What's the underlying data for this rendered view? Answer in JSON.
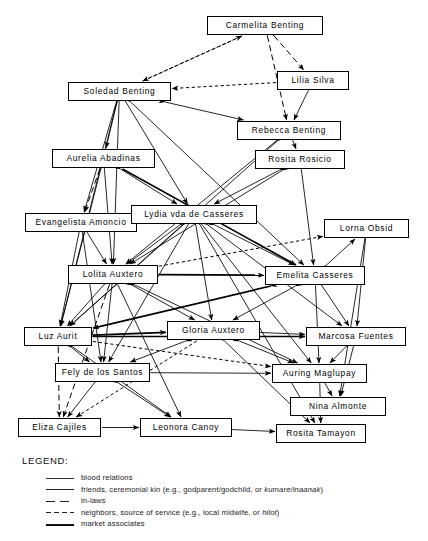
{
  "diagram": {
    "nodes": [
      {
        "id": "carmelita",
        "label": "Carmelita Benting",
        "x": 207,
        "y": 16,
        "w": 116,
        "h": 19
      },
      {
        "id": "lilia",
        "label": "Lilia Silva",
        "x": 277,
        "y": 71,
        "w": 72,
        "h": 19
      },
      {
        "id": "soledad",
        "label": "Soledad Benting",
        "x": 68,
        "y": 82,
        "w": 103,
        "h": 19
      },
      {
        "id": "rebecca",
        "label": "Rebecca Benting",
        "x": 237,
        "y": 121,
        "w": 104,
        "h": 19
      },
      {
        "id": "aurelia",
        "label": "Aurelia Abadinas",
        "x": 52,
        "y": 149,
        "w": 103,
        "h": 19
      },
      {
        "id": "rosita_r",
        "label": "Rosita Rosicio",
        "x": 255,
        "y": 150,
        "w": 90,
        "h": 19
      },
      {
        "id": "evangelista",
        "label": "Evangelista Amoncio",
        "x": 25,
        "y": 213,
        "w": 112,
        "h": 19
      },
      {
        "id": "lydia",
        "label": "Lydia vda de Casseres",
        "x": 131,
        "y": 205,
        "w": 126,
        "h": 19
      },
      {
        "id": "lorna",
        "label": "Lorna Obsid",
        "x": 324,
        "y": 219,
        "w": 85,
        "h": 19
      },
      {
        "id": "lolita",
        "label": "Lolita Auxtero",
        "x": 68,
        "y": 265,
        "w": 90,
        "h": 19
      },
      {
        "id": "emelita",
        "label": "Emelita Casseres",
        "x": 265,
        "y": 266,
        "w": 100,
        "h": 19
      },
      {
        "id": "luz",
        "label": "Luz Aurit",
        "x": 24,
        "y": 327,
        "w": 68,
        "h": 19
      },
      {
        "id": "gloria",
        "label": "Gloria Auxtero",
        "x": 167,
        "y": 321,
        "w": 93,
        "h": 19
      },
      {
        "id": "marcosa",
        "label": "Marcosa Fuentes",
        "x": 306,
        "y": 327,
        "w": 100,
        "h": 19
      },
      {
        "id": "fely",
        "label": "Fely de los Santos",
        "x": 55,
        "y": 363,
        "w": 95,
        "h": 19
      },
      {
        "id": "auring",
        "label": "Auring Maglupay",
        "x": 272,
        "y": 364,
        "w": 95,
        "h": 19
      },
      {
        "id": "nina",
        "label": "Nina Almonte",
        "x": 290,
        "y": 397,
        "w": 96,
        "h": 19
      },
      {
        "id": "eliza",
        "label": "Eliza Cajiles",
        "x": 18,
        "y": 418,
        "w": 83,
        "h": 19
      },
      {
        "id": "leonora",
        "label": "Leonora Canoy",
        "x": 140,
        "y": 418,
        "w": 92,
        "h": 19
      },
      {
        "id": "rosita_t",
        "label": "Rosita Tamayon",
        "x": 276,
        "y": 424,
        "w": 90,
        "h": 19
      }
    ],
    "edges": [
      {
        "from": "soledad",
        "to": "carmelita",
        "style": "neighbors",
        "arrows": "end"
      },
      {
        "from": "carmelita",
        "to": "soledad",
        "style": "neighbors",
        "arrows": "end"
      },
      {
        "from": "carmelita",
        "to": "rebecca",
        "style": "inlaws",
        "arrows": "both"
      },
      {
        "from": "carmelita",
        "to": "lilia",
        "style": "inlaws",
        "arrows": "both"
      },
      {
        "from": "lilia",
        "to": "rebecca",
        "style": "blood",
        "arrows": "both"
      },
      {
        "from": "lilia",
        "to": "soledad",
        "style": "neighbors",
        "arrows": "end"
      },
      {
        "from": "soledad",
        "to": "aurelia",
        "style": "blood",
        "arrows": "both"
      },
      {
        "from": "soledad",
        "to": "evangelista",
        "style": "blood",
        "arrows": "both"
      },
      {
        "from": "soledad",
        "to": "lolita",
        "style": "blood",
        "arrows": "both"
      },
      {
        "from": "soledad",
        "to": "luz",
        "style": "blood",
        "arrows": "both"
      },
      {
        "from": "soledad",
        "to": "lydia",
        "style": "blood",
        "arrows": "both"
      },
      {
        "from": "soledad",
        "to": "rebecca",
        "style": "blood",
        "arrows": "both"
      },
      {
        "from": "soledad",
        "to": "emelita",
        "style": "blood",
        "arrows": "both"
      },
      {
        "from": "aurelia",
        "to": "evangelista",
        "style": "inlaws",
        "arrows": "both"
      },
      {
        "from": "aurelia",
        "to": "lolita",
        "style": "blood",
        "arrows": "both"
      },
      {
        "from": "aurelia",
        "to": "lydia",
        "style": "blood",
        "arrows": "both"
      },
      {
        "from": "aurelia",
        "to": "emelita",
        "style": "market",
        "arrows": "end"
      },
      {
        "from": "aurelia",
        "to": "luz",
        "style": "blood",
        "arrows": "both"
      },
      {
        "from": "rebecca",
        "to": "rosita_r",
        "style": "blood",
        "arrows": "both"
      },
      {
        "from": "rebecca",
        "to": "lolita",
        "style": "blood",
        "arrows": "both"
      },
      {
        "from": "rebecca",
        "to": "luz",
        "style": "blood",
        "arrows": "both"
      },
      {
        "from": "rosita_r",
        "to": "lydia",
        "style": "blood",
        "arrows": "both"
      },
      {
        "from": "rosita_r",
        "to": "lolita",
        "style": "blood",
        "arrows": "both"
      },
      {
        "from": "rosita_r",
        "to": "emelita",
        "style": "blood",
        "arrows": "both"
      },
      {
        "from": "evangelista",
        "to": "lolita",
        "style": "blood",
        "arrows": "both"
      },
      {
        "from": "evangelista",
        "to": "lydia",
        "style": "blood",
        "arrows": "both"
      },
      {
        "from": "evangelista",
        "to": "luz",
        "style": "blood",
        "arrows": "both"
      },
      {
        "from": "evangelista",
        "to": "fely",
        "style": "blood",
        "arrows": "both"
      },
      {
        "from": "lydia",
        "to": "lolita",
        "style": "blood",
        "arrows": "both"
      },
      {
        "from": "lydia",
        "to": "emelita",
        "style": "blood",
        "arrows": "both"
      },
      {
        "from": "lydia",
        "to": "luz",
        "style": "blood",
        "arrows": "both"
      },
      {
        "from": "lydia",
        "to": "gloria",
        "style": "blood",
        "arrows": "both"
      },
      {
        "from": "lydia",
        "to": "fely",
        "style": "blood",
        "arrows": "both"
      },
      {
        "from": "lydia",
        "to": "marcosa",
        "style": "blood",
        "arrows": "both"
      },
      {
        "from": "lydia",
        "to": "auring",
        "style": "blood",
        "arrows": "both"
      },
      {
        "from": "lydia",
        "to": "rosita_t",
        "style": "blood",
        "arrows": "both"
      },
      {
        "from": "lolita",
        "to": "lorna",
        "style": "neighbors",
        "arrows": "end"
      },
      {
        "from": "lolita",
        "to": "emelita",
        "style": "market",
        "arrows": "both"
      },
      {
        "from": "lolita",
        "to": "luz",
        "style": "blood",
        "arrows": "both"
      },
      {
        "from": "lolita",
        "to": "gloria",
        "style": "blood",
        "arrows": "both"
      },
      {
        "from": "lolita",
        "to": "fely",
        "style": "blood",
        "arrows": "both"
      },
      {
        "from": "lolita",
        "to": "eliza",
        "style": "inlaws",
        "arrows": "both"
      },
      {
        "from": "lolita",
        "to": "leonora",
        "style": "blood",
        "arrows": "both"
      },
      {
        "from": "lolita",
        "to": "auring",
        "style": "blood",
        "arrows": "both"
      },
      {
        "from": "emelita",
        "to": "lorna",
        "style": "blood",
        "arrows": "both"
      },
      {
        "from": "emelita",
        "to": "marcosa",
        "style": "blood",
        "arrows": "both"
      },
      {
        "from": "emelita",
        "to": "gloria",
        "style": "blood",
        "arrows": "both"
      },
      {
        "from": "emelita",
        "to": "luz",
        "style": "market",
        "arrows": "both"
      },
      {
        "from": "emelita",
        "to": "auring",
        "style": "blood",
        "arrows": "both"
      },
      {
        "from": "lorna",
        "to": "marcosa",
        "style": "blood",
        "arrows": "both"
      },
      {
        "from": "lorna",
        "to": "nina",
        "style": "blood",
        "arrows": "both"
      },
      {
        "from": "luz",
        "to": "fely",
        "style": "blood",
        "arrows": "both"
      },
      {
        "from": "luz",
        "to": "eliza",
        "style": "inlaws",
        "arrows": "both"
      },
      {
        "from": "luz",
        "to": "gloria",
        "style": "market",
        "arrows": "both"
      },
      {
        "from": "luz",
        "to": "auring",
        "style": "neighbors",
        "arrows": "end"
      },
      {
        "from": "luz",
        "to": "leonora",
        "style": "blood",
        "arrows": "both"
      },
      {
        "from": "luz",
        "to": "marcosa",
        "style": "market",
        "arrows": "both"
      },
      {
        "from": "gloria",
        "to": "fely",
        "style": "blood",
        "arrows": "both"
      },
      {
        "from": "gloria",
        "to": "auring",
        "style": "blood",
        "arrows": "both"
      },
      {
        "from": "gloria",
        "to": "marcosa",
        "style": "blood",
        "arrows": "both"
      },
      {
        "from": "gloria",
        "to": "eliza",
        "style": "neighbors",
        "arrows": "end"
      },
      {
        "from": "gloria",
        "to": "rosita_t",
        "style": "blood",
        "arrows": "both"
      },
      {
        "from": "marcosa",
        "to": "auring",
        "style": "blood",
        "arrows": "both"
      },
      {
        "from": "marcosa",
        "to": "nina",
        "style": "blood",
        "arrows": "both"
      },
      {
        "from": "fely",
        "to": "eliza",
        "style": "blood",
        "arrows": "both"
      },
      {
        "from": "fely",
        "to": "leonora",
        "style": "blood",
        "arrows": "both"
      },
      {
        "from": "fely",
        "to": "auring",
        "style": "blood",
        "arrows": "both"
      },
      {
        "from": "auring",
        "to": "nina",
        "style": "blood",
        "arrows": "both"
      },
      {
        "from": "auring",
        "to": "rosita_t",
        "style": "blood",
        "arrows": "both"
      },
      {
        "from": "leonora",
        "to": "rosita_t",
        "style": "blood",
        "arrows": "both"
      },
      {
        "from": "eliza",
        "to": "leonora",
        "style": "blood",
        "arrows": "end"
      }
    ]
  },
  "legend": {
    "title": "LEGEND:",
    "items": [
      {
        "style": "blood",
        "text": "blood relations"
      },
      {
        "style": "friends",
        "text": "friends, ceremonial kin (e.g., godparent/godchild, or kumare/inaanak)",
        "italic": "kumare/inaanak"
      },
      {
        "style": "inlaws",
        "text": "in-laws"
      },
      {
        "style": "neighbors",
        "text": "neighbors, source of service (e.g., local midwife, or hilot)",
        "italic": "hilot"
      },
      {
        "style": "market",
        "text": "market associates"
      }
    ]
  }
}
